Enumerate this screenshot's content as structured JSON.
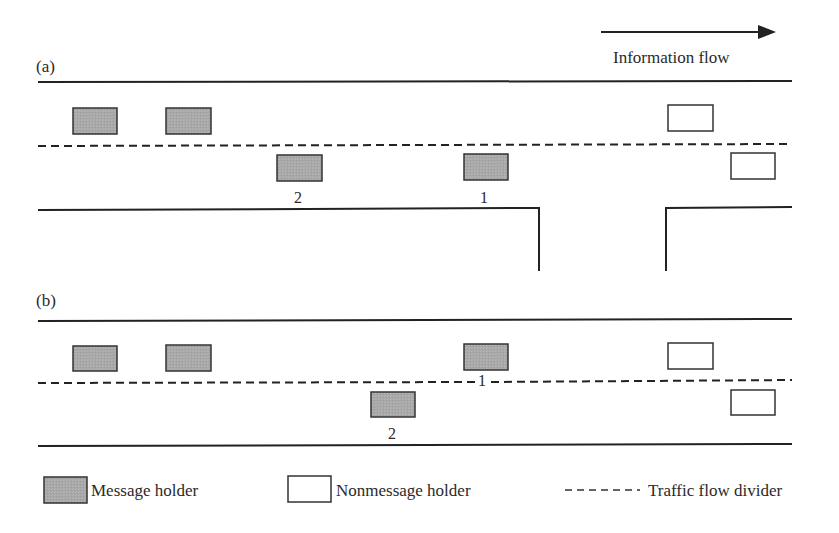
{
  "diagram": {
    "flow_arrow": {
      "label": "Information flow"
    },
    "panels": [
      {
        "id": "a",
        "label": "(a)",
        "vehicles": [
          {
            "type": "message",
            "lane": "upper",
            "label": ""
          },
          {
            "type": "message",
            "lane": "upper",
            "label": ""
          },
          {
            "type": "nonmessage",
            "lane": "upper",
            "label": ""
          },
          {
            "type": "message",
            "lane": "lower",
            "label": "2"
          },
          {
            "type": "message",
            "lane": "lower",
            "label": "1"
          },
          {
            "type": "nonmessage",
            "lane": "lower",
            "label": ""
          }
        ],
        "features": "intersection gap in lower road edge"
      },
      {
        "id": "b",
        "label": "(b)",
        "vehicles": [
          {
            "type": "message",
            "lane": "upper",
            "label": ""
          },
          {
            "type": "message",
            "lane": "upper",
            "label": ""
          },
          {
            "type": "message",
            "lane": "upper",
            "label": "1"
          },
          {
            "type": "nonmessage",
            "lane": "upper",
            "label": ""
          },
          {
            "type": "message",
            "lane": "lower",
            "label": "2"
          },
          {
            "type": "nonmessage",
            "lane": "lower",
            "label": ""
          }
        ]
      }
    ],
    "legend": {
      "items": [
        {
          "symbol": "gray-box",
          "label": "Message holder"
        },
        {
          "symbol": "white-box",
          "label": "Nonmessage holder"
        },
        {
          "symbol": "dashed-line",
          "label": "Traffic flow divider"
        }
      ]
    },
    "colors": {
      "message_fill": "#a9a9a9",
      "stroke": "#333333",
      "background": "#ffffff"
    }
  }
}
